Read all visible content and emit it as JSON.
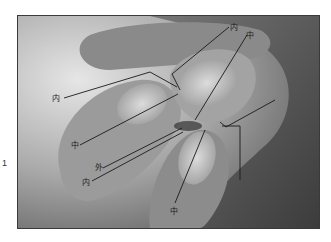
{
  "figure": {
    "number": "1",
    "labels": [
      {
        "id": "top-inner",
        "text": "内",
        "x": 230,
        "y": 30
      },
      {
        "id": "top-middle",
        "text": "中",
        "x": 246,
        "y": 38
      },
      {
        "id": "left-inner",
        "text": "内",
        "x": 52,
        "y": 101
      },
      {
        "id": "left-middle",
        "text": "中",
        "x": 71,
        "y": 148
      },
      {
        "id": "outer",
        "text": "外",
        "x": 95,
        "y": 170
      },
      {
        "id": "lower-inner",
        "text": "内",
        "x": 82,
        "y": 185
      },
      {
        "id": "bottom-middle",
        "text": "中",
        "x": 170,
        "y": 214
      }
    ]
  }
}
